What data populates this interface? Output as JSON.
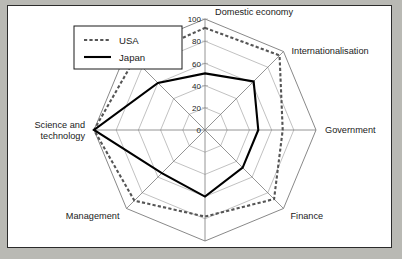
{
  "figure": {
    "background_color": "#b9b9b4",
    "plot_background_color": "#ffffff",
    "frame_border_color": "#2b2b2b"
  },
  "legend": {
    "position": "top-left",
    "entries": [
      {
        "label": "USA",
        "style": "dotted",
        "color": "#555555"
      },
      {
        "label": "Japan",
        "style": "solid",
        "color": "#000000"
      }
    ]
  },
  "chart_data": {
    "type": "radar",
    "title": "",
    "subtitle": "",
    "xlabel": "",
    "ylabel": "",
    "grid": true,
    "legend_position": "top-left",
    "rlim": [
      0,
      100
    ],
    "tick_values": [
      0,
      20,
      40,
      60,
      80,
      100
    ],
    "tick_labels": [
      "0",
      "20",
      "40",
      "60",
      "80",
      "100"
    ],
    "tick_axis": "Domestic economy",
    "categories": [
      "Domestic economy",
      "Internationalisation",
      "Government",
      "Finance",
      "Infrastructure",
      "Management",
      "Science and technology",
      "People"
    ],
    "series": [
      {
        "name": "USA",
        "color": "#555555",
        "style": "dotted",
        "values": [
          92,
          95,
          70,
          88,
          78,
          90,
          100,
          90
        ]
      },
      {
        "name": "Japan",
        "color": "#000000",
        "style": "solid",
        "values": [
          51,
          62,
          48,
          48,
          60,
          55,
          100,
          60
        ]
      }
    ]
  }
}
